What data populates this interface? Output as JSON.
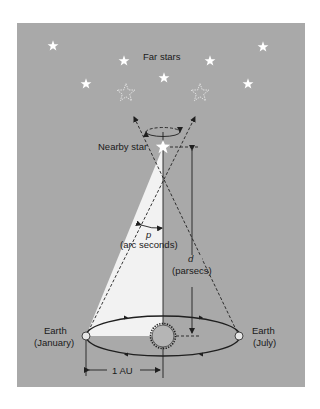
{
  "diagram": {
    "type": "stellar-parallax",
    "colors": {
      "panel_bg": "#a9a9a9",
      "page_bg": "#ffffff",
      "parallax_wedge": "#f2f2f2",
      "stars": "#ffffff",
      "lines": "#1f1f1f",
      "sun_fill": "#b5b5b5",
      "earth_fill": "#e6e6e6"
    },
    "labels": {
      "far_stars": "Far stars",
      "nearby_star": "Nearby star",
      "p_symbol": "p",
      "p_unit": "(arc seconds)",
      "d_symbol": "d",
      "d_unit": "(parsecs)",
      "earth_january_line1": "Earth",
      "earth_january_line2": "(January)",
      "earth_july_line1": "Earth",
      "earth_july_line2": "(July)",
      "au_label": "1 AU"
    },
    "far_star_count": 8,
    "apparent_positions": [
      "left-hollow-star",
      "right-hollow-star"
    ]
  }
}
